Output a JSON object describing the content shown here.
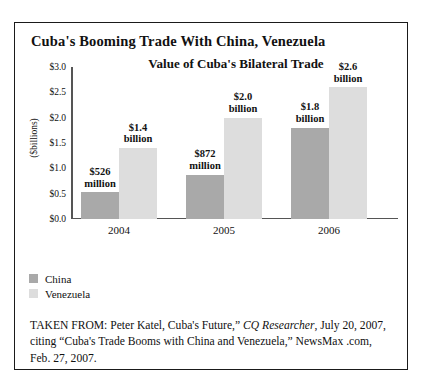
{
  "figure": {
    "title": "Cuba's Booming Trade With China, Venezuela"
  },
  "legend": {
    "items": [
      {
        "label": "China",
        "color": "#a9a9a9"
      },
      {
        "label": "Venezuela",
        "color": "#dddddd"
      }
    ]
  },
  "caption": {
    "part1": "TAKEN FROM: Peter Katel, Cuba's Future,” ",
    "italic1": "CQ Researcher",
    "part2": ", July 20, 2007, citing “Cuba's Trade Booms with China and Venezuela,” NewsMax .com, Feb. 27, 2007."
  },
  "chart_data": {
    "type": "bar",
    "title": "Value of Cuba's Bilateral Trade",
    "xlabel": "",
    "ylabel": "($billions)",
    "categories": [
      "2004",
      "2005",
      "2006"
    ],
    "ylim": [
      0.0,
      3.0
    ],
    "ytick_values": [
      0.0,
      0.5,
      1.0,
      1.5,
      2.0,
      2.5,
      3.0
    ],
    "ytick_labels": [
      "$0.0",
      "$0.5",
      "$1.0",
      "$1.5",
      "$2.0",
      "$2.5",
      "$3.0"
    ],
    "grid": false,
    "legend_position": "below-left",
    "series": [
      {
        "name": "China",
        "color": "#a9a9a9",
        "values": [
          0.526,
          0.872,
          1.8
        ],
        "data_labels": [
          "$526\nmillion",
          "$872\nmillion",
          "$1.8\nbillion"
        ]
      },
      {
        "name": "Venezuela",
        "color": "#dddddd",
        "values": [
          1.4,
          2.0,
          2.6
        ],
        "data_labels": [
          "$1.4\nbillion",
          "$2.0\nbillion",
          "$2.6\nbillion"
        ]
      }
    ]
  }
}
